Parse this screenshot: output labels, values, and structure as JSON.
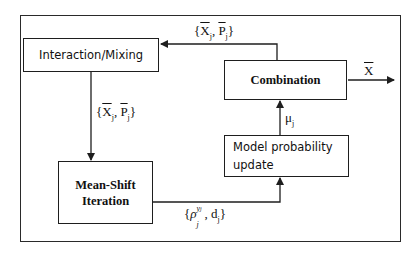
{
  "diagram": {
    "type": "flowchart",
    "title": "",
    "nodes": [
      {
        "id": "mixing",
        "label": "Interaction/Mixing"
      },
      {
        "id": "meanshift",
        "label_line1": "Mean-Shift",
        "label_line2": "Iteration"
      },
      {
        "id": "combination",
        "label": "Combination"
      },
      {
        "id": "modelprob",
        "label_line1": "Model probability",
        "label_line2": "update"
      }
    ],
    "edges": [
      {
        "from": "combination",
        "to": "mixing",
        "label": "{X̂ⱼ, P̂ⱼ}"
      },
      {
        "from": "mixing",
        "to": "meanshift",
        "label": "{X̄ⱼ, P̄ⱼ}"
      },
      {
        "from": "meanshift",
        "to": "modelprob",
        "label": "{ρⱼ^yⱼ, dⱼ}"
      },
      {
        "from": "modelprob",
        "to": "combination",
        "label": "μⱼ"
      },
      {
        "from": "combination",
        "to": "output",
        "label": "X̂"
      }
    ]
  },
  "labels": {
    "mixing": "Interaction/Mixing",
    "meanshift_1": "Mean-Shift",
    "meanshift_2": "Iteration",
    "combination": "Combination",
    "modelprob_1": "Model probability",
    "modelprob_2": "update",
    "feedback_X": "X",
    "feedback_P": "P",
    "feedback_sub": "j",
    "mixed_X": "X",
    "mixed_P": "P",
    "mixed_sub": "j",
    "likelihood_rho": "ρ",
    "likelihood_sup": "y",
    "likelihood_supsub": "j",
    "likelihood_sub": "j",
    "likelihood_d": "d",
    "mu": "μ",
    "mu_sub": "j",
    "output": "X",
    "open_brace": "{",
    "close_brace": "}",
    "comma": ","
  },
  "colors": {
    "line": "#1e1e1e",
    "text": "#111111",
    "background": "#ffffff"
  }
}
